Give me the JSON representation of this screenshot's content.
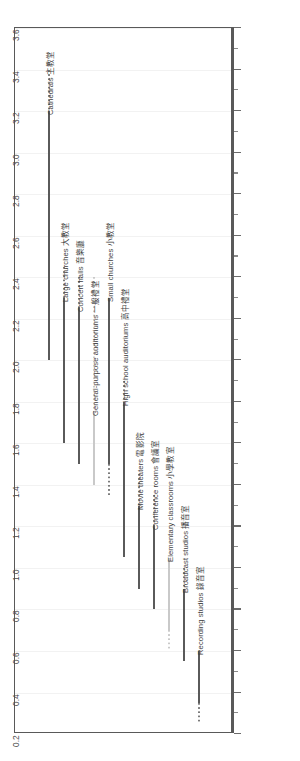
{
  "chart_data": {
    "type": "bar",
    "orientation": "vertical-ranges",
    "title": "",
    "subtitle": "",
    "xlabel": "",
    "ylabel": "",
    "ylim": [
      0.2,
      3.6
    ],
    "grid": true,
    "legend": "none",
    "tick_step": 0.2,
    "minor_tick_step": 0.1,
    "tick_labels": [
      "0.2",
      "0.4",
      "0.6",
      "0.8",
      "1.0",
      "1.2",
      "1.4",
      "1.6",
      "1.8",
      "2.0",
      "2.2",
      "2.4",
      "2.6",
      "2.8",
      "3.0",
      "3.2",
      "3.4",
      "3.6"
    ],
    "tick_values": [
      0.2,
      0.4,
      0.6,
      0.8,
      1.0,
      1.2,
      1.4,
      1.6,
      1.8,
      2.0,
      2.2,
      2.4,
      2.6,
      2.8,
      3.0,
      3.2,
      3.4,
      3.6
    ],
    "categories": [
      "Cathedrals 主教堂",
      "Large churches 大教堂",
      "Concert halls 音樂廳",
      "General-purpose auditoriums 一般禮堂",
      "Small churches 小教堂",
      "High school auditoriums 高中禮堂",
      "Movie theaters 電影院",
      "Conference rooms 會議室",
      "Elementary classrooms 小學教室",
      "Broadcast studios 播音室",
      "Recording studios 錄音室"
    ],
    "series": [
      {
        "name": "Optimal reverberation time range",
        "units": "seconds",
        "ranges": [
          {
            "category": "Cathedrals 主教堂",
            "solid_low": 2.0,
            "solid_high": 3.2,
            "dot_low": 3.2,
            "dot_high": 3.4
          },
          {
            "category": "Large churches 大教堂",
            "solid_low": 1.6,
            "solid_high": 2.3,
            "dot_low": 2.3,
            "dot_high": 2.45
          },
          {
            "category": "Concert halls 音樂廳",
            "solid_low": 1.5,
            "solid_high": 2.25,
            "dot_low": 2.25,
            "dot_high": 2.4
          },
          {
            "category": "General-purpose auditoriums 一般禮堂",
            "solid_low": 1.4,
            "solid_high": 1.75,
            "dot_low": 1.75,
            "dot_high": 2.4
          },
          {
            "category": "Small churches 小教堂",
            "solid_low": 1.5,
            "solid_high": 2.3,
            "dot_low": 1.35,
            "dot_high": 1.5
          },
          {
            "category": "High school auditoriums 高中禮堂",
            "solid_low": 1.05,
            "solid_high": 1.8,
            "dot_low": 1.8,
            "dot_high": 1.9
          },
          {
            "category": "Movie theaters 電影院",
            "solid_low": 0.9,
            "solid_high": 1.3,
            "dot_low": 1.3,
            "dot_high": 1.45
          },
          {
            "category": "Conference rooms 會議室",
            "solid_low": 0.8,
            "solid_high": 1.2,
            "dot_low": 1.2,
            "dot_high": 1.35
          },
          {
            "category": "Elementary classrooms 小學教室",
            "solid_low": 0.7,
            "solid_high": 1.05,
            "dot_low": 0.6,
            "dot_high": 0.7
          },
          {
            "category": "Broadcast studios 播音室",
            "solid_low": 0.55,
            "solid_high": 0.9,
            "dot_low": 0.9,
            "dot_high": 1.0
          },
          {
            "category": "Recording studios 錄音室",
            "solid_low": 0.35,
            "solid_high": 0.6,
            "dot_low": 0.25,
            "dot_high": 0.35
          }
        ]
      }
    ]
  },
  "axis": {
    "min_label": "0.2",
    "max_label": "3.6"
  }
}
